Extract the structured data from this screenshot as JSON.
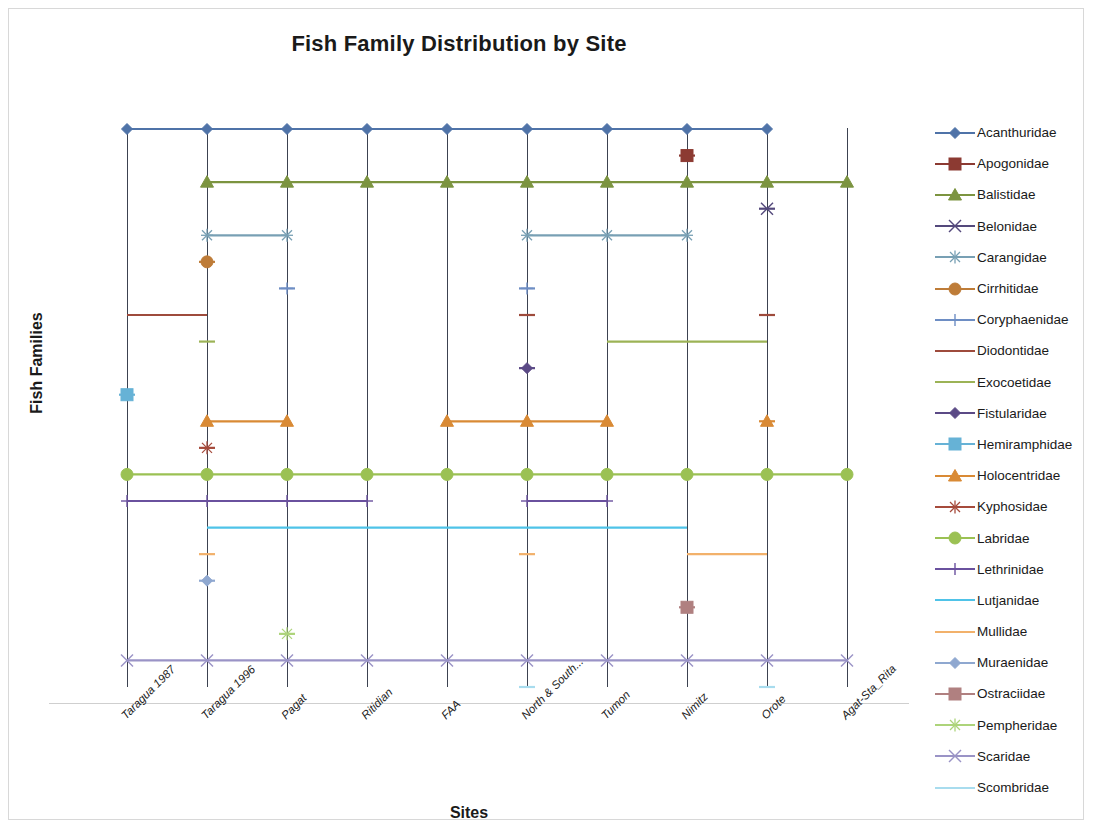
{
  "chart_data": {
    "type": "line",
    "title": "Fish Family Distribution by Site",
    "xlabel": "Sites",
    "ylabel": "Fish Families",
    "grid": false,
    "legend_position": "right",
    "categories": [
      "Taragua 1987",
      "Taragua 1996",
      "Pagat",
      "Ritidian",
      "FAA",
      "North & South...",
      "Tumon",
      "Nimitz",
      "Orote",
      "Agat-Sta_Rita"
    ],
    "series": [
      {
        "name": "Acanthuridae",
        "color": "#4F73A8",
        "marker": "diamond",
        "level": 22,
        "values": [
          1,
          1,
          1,
          1,
          1,
          1,
          1,
          1,
          1,
          0
        ]
      },
      {
        "name": "Apogonidae",
        "color": "#8C3A32",
        "marker": "square",
        "level": 21,
        "values": [
          0,
          0,
          0,
          0,
          0,
          0,
          0,
          1,
          0,
          0
        ]
      },
      {
        "name": "Balistidae",
        "color": "#7C9440",
        "marker": "triangle",
        "level": 20,
        "values": [
          0,
          1,
          1,
          1,
          1,
          1,
          1,
          1,
          1,
          1
        ]
      },
      {
        "name": "Belonidae",
        "color": "#54497C",
        "marker": "x",
        "level": 19,
        "values": [
          0,
          0,
          0,
          0,
          0,
          0,
          0,
          0,
          1,
          0
        ]
      },
      {
        "name": "Carangidae",
        "color": "#78A0B4",
        "marker": "asterisk",
        "level": 18,
        "values": [
          0,
          1,
          1,
          0,
          0,
          1,
          1,
          1,
          0,
          0
        ]
      },
      {
        "name": "Cirrhitidae",
        "color": "#BE7C38",
        "marker": "circle",
        "level": 17,
        "values": [
          0,
          1,
          0,
          0,
          0,
          0,
          0,
          0,
          0,
          0
        ]
      },
      {
        "name": "Coryphaenidae",
        "color": "#6E8EC4",
        "marker": "plus",
        "level": 16,
        "values": [
          0,
          0,
          1,
          0,
          0,
          1,
          0,
          0,
          0,
          0
        ]
      },
      {
        "name": "Diodontidae",
        "color": "#9E4B3C",
        "marker": "none",
        "level": 15,
        "values": [
          1,
          1,
          0,
          0,
          0,
          1,
          0,
          0,
          1,
          0
        ]
      },
      {
        "name": "Exocoetidae",
        "color": "#9CB356",
        "marker": "none",
        "level": 14,
        "values": [
          0,
          1,
          0,
          0,
          0,
          0,
          1,
          1,
          1,
          0
        ]
      },
      {
        "name": "Fistularidae",
        "color": "#5B4A86",
        "marker": "diamond",
        "level": 13,
        "values": [
          0,
          0,
          0,
          0,
          0,
          1,
          0,
          0,
          0,
          0
        ]
      },
      {
        "name": "Hemiramphidae",
        "color": "#66B2D6",
        "marker": "square",
        "level": 12,
        "values": [
          1,
          0,
          0,
          0,
          0,
          0,
          0,
          0,
          0,
          0
        ]
      },
      {
        "name": "Holocentridae",
        "color": "#D98A35",
        "marker": "triangle",
        "level": 11,
        "values": [
          0,
          1,
          1,
          0,
          1,
          1,
          1,
          0,
          1,
          0
        ]
      },
      {
        "name": "Kyphosidae",
        "color": "#A64B3C",
        "marker": "asterisk",
        "level": 10,
        "values": [
          0,
          1,
          0,
          0,
          0,
          0,
          0,
          0,
          0,
          0
        ]
      },
      {
        "name": "Labridae",
        "color": "#9BC153",
        "marker": "circle",
        "level": 9,
        "values": [
          1,
          1,
          1,
          1,
          1,
          1,
          1,
          1,
          1,
          1
        ]
      },
      {
        "name": "Lethrinidae",
        "color": "#6A519E",
        "marker": "plus",
        "level": 8,
        "values": [
          1,
          1,
          1,
          1,
          0,
          1,
          1,
          0,
          0,
          0
        ]
      },
      {
        "name": "Lutjanidae",
        "color": "#4FC3E8",
        "marker": "none",
        "level": 7,
        "values": [
          0,
          1,
          1,
          1,
          1,
          1,
          1,
          1,
          0,
          0
        ]
      },
      {
        "name": "Mullidae",
        "color": "#F2B16B",
        "marker": "none",
        "level": 6,
        "values": [
          0,
          1,
          0,
          0,
          0,
          1,
          0,
          1,
          1,
          0
        ]
      },
      {
        "name": "Muraenidae",
        "color": "#8FA8D0",
        "marker": "diamond",
        "level": 5,
        "values": [
          0,
          1,
          0,
          0,
          0,
          0,
          0,
          0,
          0,
          0
        ]
      },
      {
        "name": "Ostraciidae",
        "color": "#B08080",
        "marker": "square",
        "level": 4,
        "values": [
          0,
          0,
          0,
          0,
          0,
          0,
          0,
          1,
          0,
          0
        ]
      },
      {
        "name": "Pempheridae",
        "color": "#ADD47A",
        "marker": "asterisk",
        "level": 3,
        "values": [
          0,
          0,
          1,
          0,
          0,
          0,
          0,
          0,
          0,
          0
        ]
      },
      {
        "name": "Scaridae",
        "color": "#9A93C6",
        "marker": "x",
        "level": 2,
        "values": [
          1,
          1,
          1,
          1,
          1,
          1,
          1,
          1,
          1,
          1
        ]
      },
      {
        "name": "Scombridae",
        "color": "#A8DCEE",
        "marker": "none",
        "level": 1,
        "values": [
          0,
          0,
          0,
          0,
          0,
          1,
          0,
          0,
          1,
          0
        ]
      }
    ]
  },
  "legend": {
    "entries": [
      "Acanthuridae",
      "Apogonidae",
      "Balistidae",
      "Belonidae",
      "Carangidae",
      "Cirrhitidae",
      "Coryphaenidae",
      "Diodontidae",
      "Exocoetidae",
      "Fistularidae",
      "Hemiramphidae",
      "Holocentridae",
      "Kyphosidae",
      "Labridae",
      "Lethrinidae",
      "Lutjanidae",
      "Mullidae",
      "Muraenidae",
      "Ostraciidae",
      "Pempheridae",
      "Scaridae",
      "Scombridae"
    ]
  }
}
